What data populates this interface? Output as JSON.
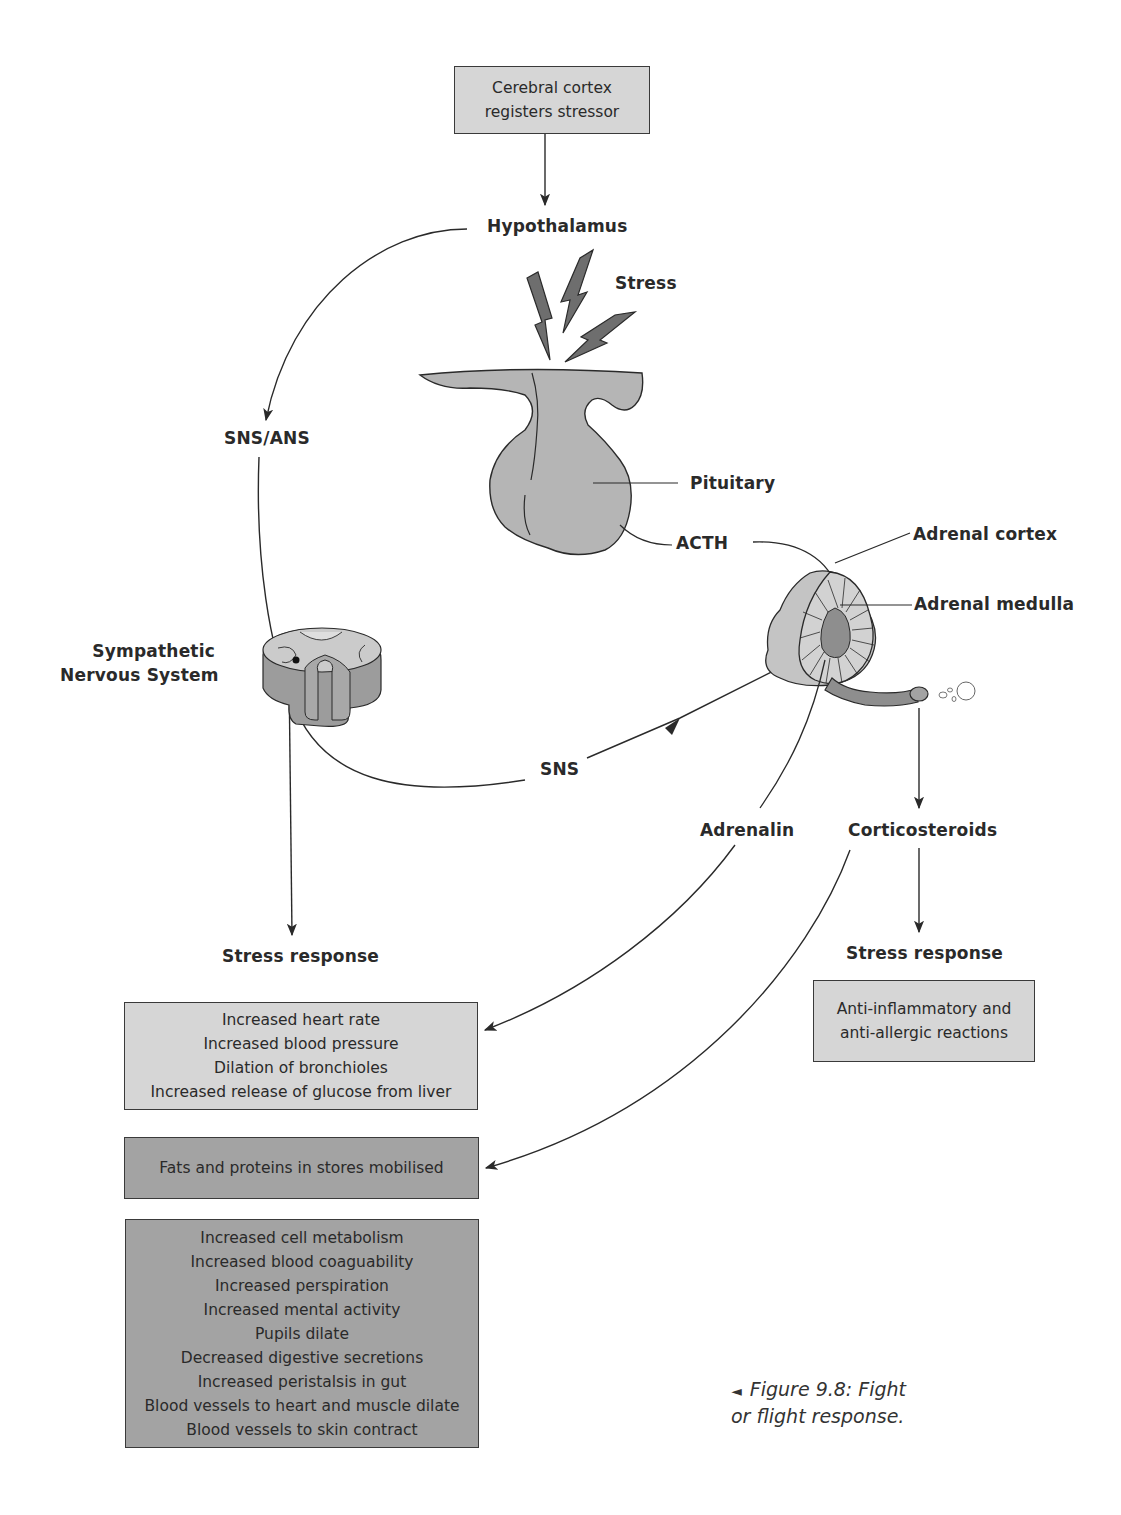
{
  "figure": {
    "caption_line1": "Figure 9.8: Fight",
    "caption_line2": "or flight response.",
    "caption_marker": "◄"
  },
  "nodes": {
    "cortex": {
      "line1": "Cerebral cortex",
      "line2": "registers stressor"
    },
    "hypothalamus": "Hypothalamus",
    "stress": "Stress",
    "sns_ans": "SNS/ANS",
    "pituitary": "Pituitary",
    "acth": "ACTH",
    "adrenal_cortex": "Adrenal cortex",
    "adrenal_medulla": "Adrenal medulla",
    "sympathetic_line1": "Sympathetic",
    "sympathetic_line2": "Nervous System",
    "sns": "SNS",
    "adrenalin": "Adrenalin",
    "corticosteroids": "Corticosteroids",
    "stress_response_left": "Stress response",
    "stress_response_right": "Stress response"
  },
  "boxes": {
    "adrenalin_effects": [
      "Increased heart rate",
      "Increased blood pressure",
      "Dilation of bronchioles",
      "Increased release of glucose from liver"
    ],
    "mobilised": [
      "Fats and proteins in stores mobilised"
    ],
    "sns_effects": [
      "Increased cell metabolism",
      "Increased blood coaguability",
      "Increased perspiration",
      "Increased mental activity",
      "Pupils dilate",
      "Decreased digestive secretions",
      "Increased peristalsis in gut",
      "Blood vessels to heart and muscle dilate",
      "Blood vessels to skin contract"
    ],
    "corticosteroid_effects": [
      "Anti-inflammatory and",
      "anti-allergic reactions"
    ]
  },
  "colors": {
    "light_fill": "#d6d6d6",
    "dark_fill": "#a3a3a3",
    "organ_fill": "#b5b5b5",
    "organ_dark": "#8e8e8e",
    "stroke": "#2a2a2a"
  }
}
